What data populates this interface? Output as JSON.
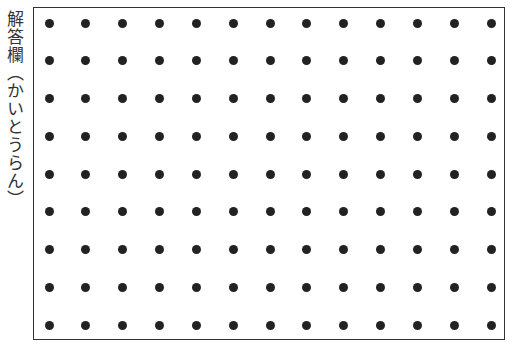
{
  "answer_label": "解答欄（かいとうらん）",
  "grid": {
    "columns": 13,
    "rows": 9,
    "dot_color": "#222222",
    "border_color": "#333333"
  }
}
